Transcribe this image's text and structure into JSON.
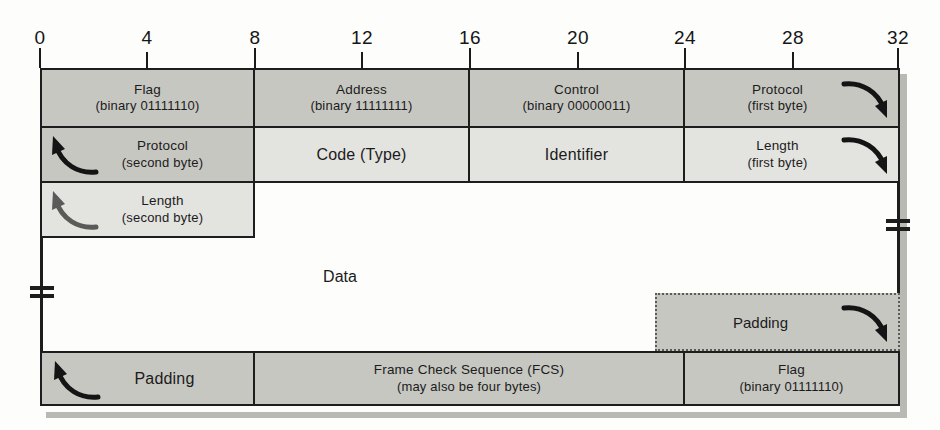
{
  "diagram": {
    "ruler": {
      "ticks": [
        "0",
        "4",
        "8",
        "12",
        "16",
        "20",
        "24",
        "28",
        "32"
      ],
      "bit_positions": [
        0,
        4,
        8,
        12,
        16,
        20,
        24,
        28,
        32
      ]
    },
    "colors": {
      "shade_dark": "#c7c7c2",
      "shade_light": "#e3e3e0",
      "border": "#1d1d1d",
      "background": "#fdfdfc",
      "dotted_border": "#5b5b58"
    },
    "rows": [
      {
        "name": "row-1",
        "fields": [
          {
            "label": "Flag",
            "sub": "(binary 01111110)",
            "bits": [
              0,
              8
            ],
            "shade": "dark",
            "arrow": "none"
          },
          {
            "label": "Address",
            "sub": "(binary 11111111)",
            "bits": [
              8,
              16
            ],
            "shade": "dark",
            "arrow": "none"
          },
          {
            "label": "Control",
            "sub": "(binary 00000011)",
            "bits": [
              16,
              24
            ],
            "shade": "dark",
            "arrow": "none"
          },
          {
            "label": "Protocol",
            "sub": "(first byte)",
            "bits": [
              24,
              32
            ],
            "shade": "dark",
            "arrow": "down-right"
          }
        ]
      },
      {
        "name": "row-2",
        "fields": [
          {
            "label": "Protocol",
            "sub": "(second byte)",
            "bits": [
              0,
              8
            ],
            "shade": "dark",
            "arrow": "up-left"
          },
          {
            "label": "Code (Type)",
            "sub": "",
            "bits": [
              8,
              16
            ],
            "shade": "light",
            "arrow": "none"
          },
          {
            "label": "Identifier",
            "sub": "",
            "bits": [
              16,
              24
            ],
            "shade": "light",
            "arrow": "none"
          },
          {
            "label": "Length",
            "sub": "(first byte)",
            "bits": [
              24,
              32
            ],
            "shade": "light",
            "arrow": "down-right"
          }
        ]
      },
      {
        "name": "row-3",
        "fields": [
          {
            "label": "Length",
            "sub": "(second byte)",
            "bits": [
              0,
              8
            ],
            "shade": "light",
            "arrow": "up-left"
          }
        ]
      },
      {
        "name": "row-data",
        "fields": [
          {
            "label": "Data",
            "sub": "",
            "bits": [
              0,
              32
            ],
            "shade": "none",
            "arrow": "none"
          }
        ]
      },
      {
        "name": "row-padding-dotted",
        "fields": [
          {
            "label": "Padding",
            "sub": "",
            "bits": [
              23,
              32
            ],
            "shade": "dark",
            "arrow": "down-right",
            "style": "dotted"
          }
        ]
      },
      {
        "name": "row-last",
        "fields": [
          {
            "label": "Padding",
            "sub": "",
            "bits": [
              0,
              8
            ],
            "shade": "dark",
            "arrow": "up-left"
          },
          {
            "label": "Frame Check Sequence (FCS)",
            "sub": "(may also be four bytes)",
            "bits": [
              8,
              24
            ],
            "shade": "dark",
            "arrow": "none"
          },
          {
            "label": "Flag",
            "sub": "(binary 01111110)",
            "bits": [
              24,
              32
            ],
            "shade": "dark",
            "arrow": "none"
          }
        ]
      }
    ],
    "break_marks": [
      {
        "name": "break-mark-left",
        "side": "left"
      },
      {
        "name": "break-mark-right",
        "side": "right"
      }
    ]
  }
}
